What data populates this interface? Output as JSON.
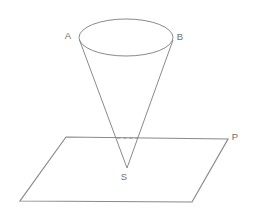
{
  "figure": {
    "background_color": "#ffffff",
    "stroke_color": "#8a8a8a",
    "plane_stroke_color": "#8a8a8a",
    "label_color": "#6f6f6f",
    "labels": {
      "a": "A",
      "b": "B",
      "s": "S",
      "p": "P"
    },
    "geometry": {
      "ellipse": {
        "cx": 126,
        "cy": 37.5,
        "rx": 47,
        "ry": 18.5
      },
      "apex": {
        "x": 127,
        "y": 168
      },
      "cone_left_contact": {
        "x": 79.5,
        "y": 40
      },
      "cone_right_contact": {
        "x": 173,
        "y": 40
      },
      "plane": {
        "top_left": {
          "x": 66,
          "y": 137
        },
        "top_right": {
          "x": 228,
          "y": 139
        },
        "bottom_right": {
          "x": 192,
          "y": 202
        },
        "bottom_left": {
          "x": 20,
          "y": 201
        }
      },
      "intersection_dash": {
        "x1": 117,
        "y1": 138,
        "x2": 138,
        "y2": 138
      },
      "label_positions": {
        "a": {
          "x": 68,
          "y": 36
        },
        "b": {
          "x": 180,
          "y": 37
        },
        "s": {
          "x": 124,
          "y": 177
        },
        "p": {
          "x": 235,
          "y": 137
        }
      }
    }
  }
}
